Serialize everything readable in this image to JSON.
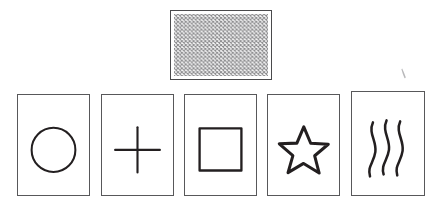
{
  "scene": {
    "title": "Zener ESP card set",
    "background_color": "#ffffff",
    "width": 442,
    "height": 215,
    "ink_color": "#231f20",
    "card_border_color": "#58585a",
    "hatch_color": "#8a8a8c"
  },
  "face_down_card": {
    "label": "Face-down card",
    "symbol_name": "cross-hatch-pattern",
    "x": 170,
    "y": 10,
    "width": 102,
    "height": 70
  },
  "cards": [
    {
      "label": "Circle",
      "symbol_name": "circle-symbol",
      "x": 17,
      "y": 94,
      "width": 73,
      "height": 102
    },
    {
      "label": "Plus",
      "symbol_name": "plus-symbol",
      "x": 101,
      "y": 94,
      "width": 73,
      "height": 102
    },
    {
      "label": "Square",
      "symbol_name": "square-symbol",
      "x": 184,
      "y": 94,
      "width": 73,
      "height": 102
    },
    {
      "label": "Star",
      "symbol_name": "star-symbol",
      "x": 267,
      "y": 94,
      "width": 73,
      "height": 102
    },
    {
      "label": "Waves",
      "symbol_name": "waves-symbol",
      "x": 351,
      "y": 91,
      "width": 74,
      "height": 105
    }
  ],
  "stray_mark": {
    "label": "Stray pen mark",
    "x": 401,
    "y": 68,
    "width": 7,
    "height": 11
  }
}
